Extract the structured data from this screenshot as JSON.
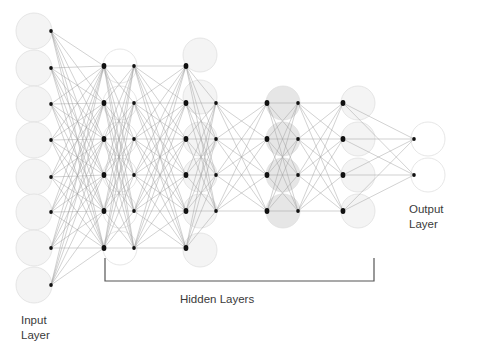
{
  "labels": {
    "input_line1": "Input",
    "input_line2": "Layer",
    "hidden": "Hidden Layers",
    "output_line1": "Output",
    "output_line2": "Layer"
  },
  "colors": {
    "background": "#ffffff",
    "edge": "#9a9a9a",
    "dot": "#111111",
    "circle_light": "#f4f4f4",
    "circle_gray": "#e6e6e6",
    "circle_stroke": "#e0e0e0",
    "bracket": "#555555",
    "text": "#3a3a3a"
  },
  "layers": [
    {
      "name": "input",
      "circle_x": 34,
      "r": 18,
      "fill": "light",
      "dot_right_x": 51,
      "ys": [
        31,
        68,
        104,
        140,
        177,
        212,
        248,
        285
      ]
    },
    {
      "name": "hidden-1",
      "circle_x": 120,
      "r": 17,
      "fill": "white",
      "dot_left_x": 104,
      "dot_right_x": 104,
      "ys": [
        66,
        103,
        139,
        175,
        211,
        248
      ]
    },
    {
      "name": "hidden-2",
      "circle_x": 200,
      "r": 17,
      "fill": "light",
      "dot_left_x": 134,
      "dot_right_x": 186,
      "ys": [
        66,
        103,
        139,
        175,
        211,
        248
      ]
    },
    {
      "name": "hidden-3",
      "circle_x": 283,
      "r": 17,
      "fill": "gray",
      "dot_left_x": 216,
      "dot_right_x": 267,
      "ys": [
        103,
        139,
        175,
        211
      ]
    },
    {
      "name": "hidden-4",
      "circle_x": 358,
      "r": 17,
      "fill": "light",
      "dot_left_x": 298,
      "dot_right_x": 343,
      "ys": [
        103,
        139,
        175,
        211
      ]
    },
    {
      "name": "output",
      "circle_x": 428,
      "r": 17,
      "fill": "white",
      "dot_left_x": 414,
      "ys": [
        139,
        175
      ]
    }
  ],
  "hidden_circles_h2": [
    55,
    97,
    139,
    175,
    211,
    250
  ],
  "bracket": {
    "x1": 105,
    "x2": 374,
    "y_top": 258,
    "y_bottom": 281
  }
}
